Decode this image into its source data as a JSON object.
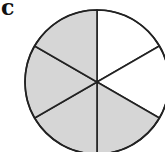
{
  "figure": {
    "label": "c",
    "total_sectors": 6,
    "shaded_sectors": 4,
    "unshaded_sectors": 2,
    "colors": {
      "shaded": "#d6d6d6",
      "unshaded": "#ffffff",
      "stroke": "#222222"
    },
    "sectors": [
      {
        "index": 0,
        "from_deg": 0,
        "to_deg": 60,
        "shaded": false
      },
      {
        "index": 1,
        "from_deg": 60,
        "to_deg": 120,
        "shaded": false
      },
      {
        "index": 2,
        "from_deg": 120,
        "to_deg": 180,
        "shaded": true
      },
      {
        "index": 3,
        "from_deg": 180,
        "to_deg": 240,
        "shaded": true
      },
      {
        "index": 4,
        "from_deg": 240,
        "to_deg": 300,
        "shaded": true
      },
      {
        "index": 5,
        "from_deg": 300,
        "to_deg": 360,
        "shaded": true
      }
    ]
  }
}
